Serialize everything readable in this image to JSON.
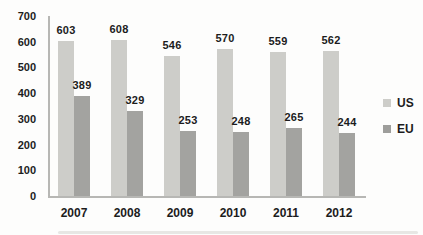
{
  "colors": {
    "us_bar": "#cdcdc9",
    "eu_bar": "#a3a3a0",
    "axis": "#b7b7b4",
    "text": "#1c1c1c",
    "background": "#fdfdfc"
  },
  "legend": {
    "items": [
      {
        "label": "US",
        "color": "#cdcdc9"
      },
      {
        "label": "EU",
        "color": "#9e9e9b"
      }
    ]
  },
  "chart_data": {
    "type": "bar",
    "title": "",
    "xlabel": "",
    "ylabel": "",
    "categories": [
      "2007",
      "2008",
      "2009",
      "2010",
      "2011",
      "2012"
    ],
    "series": [
      {
        "name": "US",
        "color": "#cdcdc9",
        "values": [
          603,
          608,
          546,
          570,
          559,
          562
        ]
      },
      {
        "name": "EU",
        "color": "#a3a3a0",
        "values": [
          389,
          329,
          253,
          248,
          265,
          244
        ]
      }
    ],
    "ylim": [
      0,
      700
    ],
    "ytick_step": 100,
    "yticks": [
      0,
      100,
      200,
      300,
      400,
      500,
      600,
      700
    ],
    "grid": false,
    "data_labels": true,
    "legend_position": "right"
  }
}
